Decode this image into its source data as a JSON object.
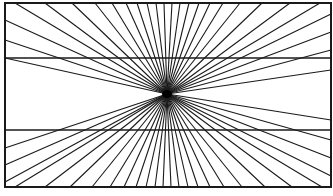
{
  "diagram": {
    "name": "Hering illusion",
    "width": 333,
    "height": 196,
    "background": "#ffffff",
    "stroke_color": "#1a1a1a",
    "frame": {
      "x": 5,
      "y": 3,
      "width": 326,
      "height": 184,
      "stroke_width": 2
    },
    "center": {
      "x": 167,
      "y": 94
    },
    "horizontal_lines": [
      {
        "y": 58,
        "x1": 5,
        "x2": 331,
        "stroke_width": 1.4
      },
      {
        "y": 130,
        "x1": 5,
        "x2": 331,
        "stroke_width": 1.4
      }
    ],
    "ray_stroke_width": 1.1,
    "rays": [
      [
        5,
        20
      ],
      [
        5,
        40
      ],
      [
        5,
        58
      ],
      [
        5,
        148
      ],
      [
        5,
        165
      ],
      [
        5,
        182
      ],
      [
        331,
        14
      ],
      [
        331,
        32
      ],
      [
        331,
        50
      ],
      [
        331,
        70
      ],
      [
        331,
        120
      ],
      [
        331,
        140
      ],
      [
        331,
        158
      ],
      [
        331,
        176
      ],
      [
        15,
        3
      ],
      [
        45,
        3
      ],
      [
        72,
        3
      ],
      [
        95,
        3
      ],
      [
        112,
        3
      ],
      [
        126,
        3
      ],
      [
        137,
        3
      ],
      [
        147,
        3
      ],
      [
        156,
        3
      ],
      [
        164,
        3
      ],
      [
        172,
        3
      ],
      [
        180,
        3
      ],
      [
        189,
        3
      ],
      [
        199,
        3
      ],
      [
        210,
        3
      ],
      [
        223,
        3
      ],
      [
        240,
        3
      ],
      [
        262,
        3
      ],
      [
        290,
        3
      ],
      [
        320,
        3
      ],
      [
        15,
        187
      ],
      [
        45,
        187
      ],
      [
        70,
        187
      ],
      [
        92,
        187
      ],
      [
        110,
        187
      ],
      [
        124,
        187
      ],
      [
        136,
        187
      ],
      [
        146,
        187
      ],
      [
        155,
        187
      ],
      [
        163,
        187
      ],
      [
        171,
        187
      ],
      [
        179,
        187
      ],
      [
        188,
        187
      ],
      [
        198,
        187
      ],
      [
        210,
        187
      ],
      [
        224,
        187
      ],
      [
        242,
        187
      ],
      [
        265,
        187
      ],
      [
        292,
        187
      ],
      [
        322,
        187
      ]
    ]
  }
}
